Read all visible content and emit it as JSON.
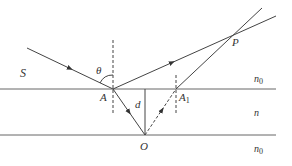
{
  "diagram": {
    "type": "optics-ray-diagram",
    "colors": {
      "line": "#555555",
      "text": "#333333",
      "background": "#ffffff"
    },
    "labels": {
      "source": "S",
      "angle": "θ",
      "point_A": "A",
      "point_A1_base": "A",
      "point_A1_sub": "1",
      "point_P": "P",
      "point_O": "O",
      "thickness": "d",
      "medium_top_base": "n",
      "medium_top_sub": "0",
      "medium_middle": "n",
      "medium_bottom_base": "n",
      "medium_bottom_sub": "0"
    },
    "points": {
      "S_start": [
        27,
        48
      ],
      "A": [
        113,
        89
      ],
      "A1": [
        176,
        89
      ],
      "O": [
        145,
        135
      ],
      "P": [
        234,
        34
      ]
    }
  }
}
